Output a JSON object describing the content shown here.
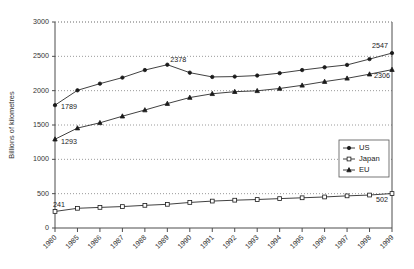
{
  "chart_data": {
    "type": "line",
    "title": "",
    "xlabel": "",
    "ylabel": "Billions of kilometres",
    "ylim": [
      0,
      3000
    ],
    "ytick_labels": [
      "0",
      "500",
      "1000",
      "1500",
      "2000",
      "2500",
      "3000"
    ],
    "ytick_values": [
      0,
      500,
      1000,
      1500,
      2000,
      2500,
      3000
    ],
    "grid": true,
    "legend_position": "right-middle",
    "categories": [
      "1980",
      "1985",
      "1986",
      "1987",
      "1988",
      "1989",
      "1990",
      "1991",
      "1992",
      "1993",
      "1994",
      "1995",
      "1996",
      "1997",
      "1998",
      "1999"
    ],
    "series": [
      {
        "name": "US",
        "marker": "dot",
        "values": [
          1789,
          2005,
          2102,
          2190,
          2300,
          2378,
          2262,
          2200,
          2205,
          2220,
          2255,
          2300,
          2340,
          2375,
          2460,
          2547
        ]
      },
      {
        "name": "Japan",
        "marker": "square",
        "values": [
          241,
          287,
          300,
          312,
          330,
          345,
          372,
          392,
          405,
          415,
          428,
          440,
          452,
          468,
          480,
          502
        ]
      },
      {
        "name": "EU",
        "marker": "triangle",
        "values": [
          1293,
          1455,
          1532,
          1628,
          1718,
          1812,
          1900,
          1955,
          1985,
          1998,
          2032,
          2078,
          2132,
          2180,
          2240,
          2306
        ]
      }
    ],
    "annotations": [
      {
        "text": "1789",
        "series": "US",
        "index": 0
      },
      {
        "text": "2378",
        "series": "US",
        "index": 5
      },
      {
        "text": "2547",
        "series": "US",
        "index": 15
      },
      {
        "text": "1293",
        "series": "EU",
        "index": 0
      },
      {
        "text": "2306",
        "series": "EU",
        "index": 15
      },
      {
        "text": "241",
        "series": "Japan",
        "index": 0
      },
      {
        "text": "502",
        "series": "Japan",
        "index": 15
      }
    ]
  },
  "legend": {
    "items": [
      {
        "label": "US"
      },
      {
        "label": "Japan"
      },
      {
        "label": "EU"
      }
    ]
  }
}
